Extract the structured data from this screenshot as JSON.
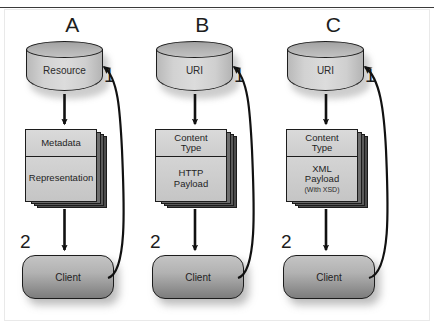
{
  "diagram": {
    "type": "flow-diagram",
    "background": "#ffffff",
    "stroke_color": "#1c1c1c",
    "fill_light": "#d2d2d2",
    "fill_dark": "#8e8e8e",
    "columns": [
      {
        "letter": "A",
        "source": {
          "shape": "cylinder",
          "label": "Resource"
        },
        "payload": {
          "shape": "stacked-document",
          "top_label": "Metadata",
          "bottom_label": "Representation",
          "sub_label": ""
        },
        "target": {
          "shape": "rounded-rect",
          "label": "Client"
        },
        "step_down": "2",
        "step_up": "1"
      },
      {
        "letter": "B",
        "source": {
          "shape": "cylinder",
          "label": "URI"
        },
        "payload": {
          "shape": "stacked-document",
          "top_label": "Content\nType",
          "bottom_label": "HTTP\nPayload",
          "sub_label": ""
        },
        "target": {
          "shape": "rounded-rect",
          "label": "Client"
        },
        "step_down": "2",
        "step_up": "1"
      },
      {
        "letter": "C",
        "source": {
          "shape": "cylinder",
          "label": "URI"
        },
        "payload": {
          "shape": "stacked-document",
          "top_label": "Content\nType",
          "bottom_label": "XML\nPayload",
          "sub_label": "(With XSD)"
        },
        "target": {
          "shape": "rounded-rect",
          "label": "Client"
        },
        "step_down": "2",
        "step_up": "1"
      }
    ],
    "arrows": {
      "down_label": "source-to-payload-to-client",
      "return_label": "client-to-source-request"
    }
  }
}
